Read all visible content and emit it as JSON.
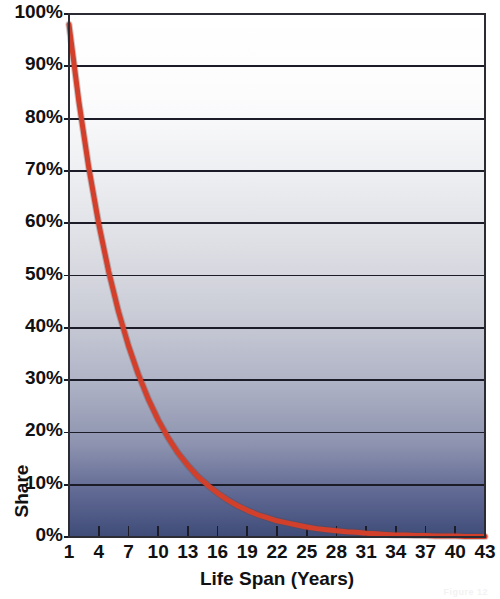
{
  "chart_data": {
    "type": "line",
    "title": "",
    "xlabel": "Life Span (Years)",
    "ylabel": "Share",
    "xlim": [
      1,
      43
    ],
    "ylim": [
      0,
      100
    ],
    "grid": true,
    "legend": "none",
    "xtick_labels": [
      "1",
      "4",
      "7",
      "10",
      "13",
      "16",
      "19",
      "22",
      "25",
      "28",
      "31",
      "34",
      "37",
      "40",
      "43"
    ],
    "xtick_values": [
      1,
      4,
      7,
      10,
      13,
      16,
      19,
      22,
      25,
      28,
      31,
      34,
      37,
      40,
      43
    ],
    "ytick_labels": [
      "0%",
      "10%",
      "20%",
      "30%",
      "40%",
      "50%",
      "60%",
      "70%",
      "80%",
      "90%",
      "100%"
    ],
    "ytick_values": [
      0,
      10,
      20,
      30,
      40,
      50,
      60,
      70,
      80,
      90,
      100
    ],
    "series": [
      {
        "name": "Share",
        "color": "#d2402c",
        "x": [
          1,
          2,
          3,
          4,
          5,
          6,
          7,
          8,
          9,
          10,
          11,
          12,
          13,
          14,
          15,
          16,
          17,
          18,
          19,
          20,
          21,
          22,
          23,
          24,
          25,
          26,
          27,
          28,
          29,
          30,
          31,
          32,
          33,
          34,
          35,
          36,
          37,
          38,
          39,
          40,
          41,
          42,
          43
        ],
        "values": [
          98.0,
          83.2,
          70.6,
          59.9,
          50.8,
          43.1,
          36.6,
          31.1,
          26.4,
          22.4,
          19.0,
          16.1,
          13.7,
          11.6,
          9.9,
          8.4,
          7.1,
          6.0,
          5.1,
          4.3,
          3.7,
          3.1,
          2.7,
          2.3,
          1.9,
          1.6,
          1.4,
          1.2,
          1.0,
          0.9,
          0.7,
          0.6,
          0.5,
          0.4,
          0.4,
          0.3,
          0.3,
          0.2,
          0.2,
          0.2,
          0.1,
          0.1,
          0.1
        ]
      }
    ]
  },
  "plot_area": {
    "left": 69,
    "top": 14,
    "right": 485,
    "bottom": 537
  },
  "colors": {
    "curve": "#d2402c",
    "gridline": "#1c1c28",
    "axis_border": "#2b2b33",
    "bg_top": "#ffffff",
    "bg_mid": "#d6d7dd",
    "bg_bottom": "#43507a",
    "text": "#111111"
  },
  "caption": {
    "text": "Figure 12"
  }
}
